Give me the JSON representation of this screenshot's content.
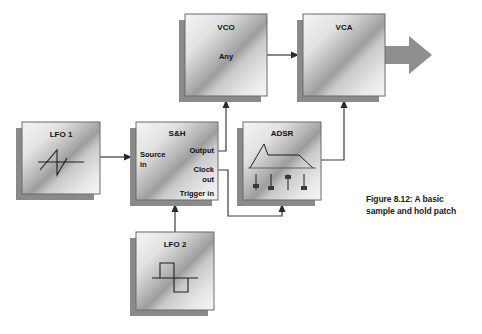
{
  "figure": {
    "caption_line1": "Figure 8.12: A basic",
    "caption_line2": "sample and hold patch"
  },
  "colors": {
    "box_light": "#f2f2f2",
    "box_mid": "#9a9a9a",
    "box_edge": "#6e6e6e",
    "shadow": "#808080",
    "line": "#333333",
    "arrow_block": "#8c8c8c",
    "text": "#111111",
    "background": "#ffffff"
  },
  "modules": [
    {
      "id": "lfo1",
      "title": "LFO 1",
      "waveform": "sawtooth",
      "x": 22,
      "y": 122,
      "w": 78,
      "h": 72
    },
    {
      "id": "sh",
      "title": "S&H",
      "ports": {
        "source_in": "Source\nin",
        "source_in_l1": "Source",
        "source_in_l2": "in",
        "output": "Output",
        "clock_out_l1": "Clock",
        "clock_out_l2": "out",
        "trigger_in": "Trigger in"
      },
      "x": 136,
      "y": 122,
      "w": 82,
      "h": 78
    },
    {
      "id": "adsr",
      "title": "ADSR",
      "sliders": [
        {
          "name": "attack",
          "value": 0.45
        },
        {
          "name": "decay",
          "value": 0.2
        },
        {
          "name": "sustain",
          "value": 0.82
        },
        {
          "name": "release",
          "value": 0.25
        }
      ],
      "envelope": "adsr-curve",
      "x": 243,
      "y": 122,
      "w": 78,
      "h": 78
    },
    {
      "id": "vco",
      "title": "VCO",
      "body_label": "Any",
      "x": 185,
      "y": 14,
      "w": 82,
      "h": 82
    },
    {
      "id": "vca",
      "title": "VCA",
      "x": 303,
      "y": 14,
      "w": 82,
      "h": 82
    },
    {
      "id": "lfo2",
      "title": "LFO 2",
      "waveform": "square",
      "x": 136,
      "y": 232,
      "w": 78,
      "h": 78
    }
  ],
  "connections": [
    {
      "name": "lfo1-to-sh-source-in",
      "from": "lfo1",
      "to": "sh",
      "label": ""
    },
    {
      "name": "sh-output-to-vco",
      "from": "sh",
      "to": "vco",
      "label": ""
    },
    {
      "name": "sh-clock-out-to-adsr-trigger",
      "from": "sh",
      "to": "adsr",
      "label": ""
    },
    {
      "name": "lfo2-to-sh-trigger-in",
      "from": "lfo2",
      "to": "sh",
      "label": ""
    },
    {
      "name": "vco-to-vca",
      "from": "vco",
      "to": "vca",
      "label": ""
    },
    {
      "name": "adsr-to-vca-cv",
      "from": "adsr",
      "to": "vca",
      "label": ""
    },
    {
      "name": "vca-audio-out",
      "from": "vca",
      "to": "output",
      "label": ""
    }
  ]
}
